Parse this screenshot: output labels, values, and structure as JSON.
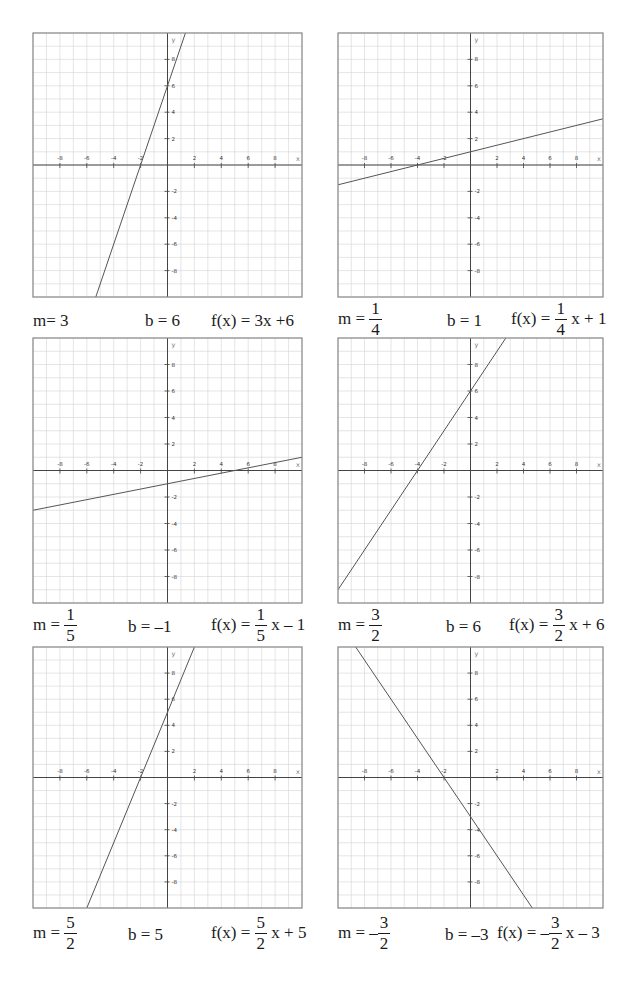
{
  "chart_data": [
    {
      "type": "line",
      "title": "f(x) = 3x + 6",
      "xlabel": "x",
      "ylabel": "y",
      "xlim": [
        -10,
        10
      ],
      "ylim": [
        -10,
        10
      ],
      "grid": true,
      "x_ticks": [
        -8,
        -6,
        -4,
        -2,
        2,
        4,
        6,
        8
      ],
      "y_ticks": [
        8,
        6,
        4,
        2,
        -2,
        -4,
        -6,
        -8
      ],
      "series": [
        {
          "name": "f(x)",
          "slope": 3,
          "intercept": 6
        }
      ],
      "caption": {
        "m": "3",
        "b": "6",
        "f": "3x +6"
      }
    },
    {
      "type": "line",
      "title": "f(x) = 1/4 x + 1",
      "xlabel": "x",
      "ylabel": "y",
      "xlim": [
        -10,
        10
      ],
      "ylim": [
        -10,
        10
      ],
      "grid": true,
      "x_ticks": [
        -8,
        -6,
        -4,
        -2,
        2,
        4,
        6,
        8
      ],
      "y_ticks": [
        8,
        6,
        4,
        2,
        -2,
        -4,
        -6,
        -8
      ],
      "series": [
        {
          "name": "f(x)",
          "slope": 0.25,
          "intercept": 1
        }
      ],
      "caption": {
        "m_num": "1",
        "m_den": "4",
        "b": "1",
        "f_num": "1",
        "f_den": "4",
        "f_rest": "x + 1"
      }
    },
    {
      "type": "line",
      "title": "f(x) = 1/5 x - 1",
      "xlabel": "x",
      "ylabel": "y",
      "xlim": [
        -10,
        10
      ],
      "ylim": [
        -10,
        10
      ],
      "grid": true,
      "x_ticks": [
        -8,
        -6,
        -4,
        -2,
        2,
        4,
        6,
        8
      ],
      "y_ticks": [
        8,
        6,
        4,
        2,
        -2,
        -4,
        -6,
        -8
      ],
      "series": [
        {
          "name": "f(x)",
          "slope": 0.2,
          "intercept": -1
        }
      ],
      "caption": {
        "m_num": "1",
        "m_den": "5",
        "b": "–1",
        "f_num": "1",
        "f_den": "5",
        "f_rest": "x – 1"
      }
    },
    {
      "type": "line",
      "title": "f(x) = 3/2 x + 6",
      "xlabel": "x",
      "ylabel": "y",
      "xlim": [
        -10,
        10
      ],
      "ylim": [
        -10,
        10
      ],
      "grid": true,
      "x_ticks": [
        -8,
        -6,
        -4,
        -2,
        2,
        4,
        6,
        8
      ],
      "y_ticks": [
        8,
        6,
        4,
        2,
        -2,
        -4,
        -6,
        -8
      ],
      "series": [
        {
          "name": "f(x)",
          "slope": 1.5,
          "intercept": 6
        }
      ],
      "caption": {
        "m_num": "3",
        "m_den": "2",
        "b": "6",
        "f_num": "3",
        "f_den": "2",
        "f_rest": "x + 6"
      }
    },
    {
      "type": "line",
      "title": "f(x) = 5/2 x + 5",
      "xlabel": "x",
      "ylabel": "y",
      "xlim": [
        -10,
        10
      ],
      "ylim": [
        -10,
        10
      ],
      "grid": true,
      "x_ticks": [
        -8,
        -6,
        -4,
        -2,
        2,
        4,
        6,
        8
      ],
      "y_ticks": [
        8,
        6,
        4,
        2,
        -2,
        -4,
        -6,
        -8
      ],
      "series": [
        {
          "name": "f(x)",
          "slope": 2.5,
          "intercept": 5
        }
      ],
      "caption": {
        "m_num": "5",
        "m_den": "2",
        "b": "5",
        "f_num": "5",
        "f_den": "2",
        "f_rest": "x + 5"
      }
    },
    {
      "type": "line",
      "title": "f(x) = -3/2 x - 3",
      "xlabel": "x",
      "ylabel": "y",
      "xlim": [
        -10,
        10
      ],
      "ylim": [
        -10,
        10
      ],
      "grid": true,
      "x_ticks": [
        -8,
        -6,
        -4,
        -2,
        2,
        4,
        6,
        8
      ],
      "y_ticks": [
        8,
        6,
        4,
        2,
        -2,
        -4,
        -6,
        -8
      ],
      "series": [
        {
          "name": "f(x)",
          "slope": -1.5,
          "intercept": -3
        }
      ],
      "caption": {
        "m_sign": "–",
        "m_num": "3",
        "m_den": "2",
        "b": "–3",
        "f_sign": "–",
        "f_num": "3",
        "f_den": "2",
        "f_rest": "x – 3"
      }
    }
  ],
  "labels": {
    "m_prefix_eq": "m =",
    "m_prefix_tight": "m=",
    "b_prefix": "b =",
    "f_prefix": "f(x) =",
    "x_axis": "x",
    "y_axis": "y"
  },
  "style": {
    "grid_color": "#d4d4d4",
    "axis_color": "#444444",
    "frame_color": "#8a8a8a",
    "line_color": "#555555"
  }
}
